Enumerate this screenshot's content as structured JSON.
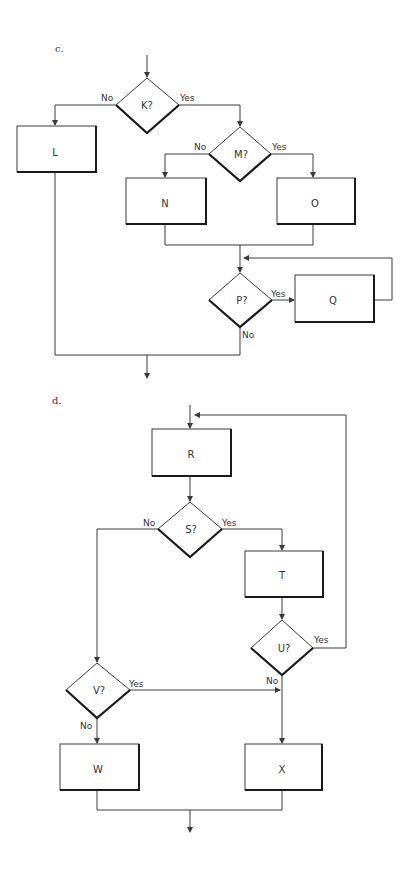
{
  "parts": {
    "c": {
      "label": "c.",
      "decisions": {
        "K": "K?",
        "M": "M?",
        "P": "P?"
      },
      "processes": {
        "L": "L",
        "N": "N",
        "O": "O",
        "Q": "Q"
      },
      "edges": {
        "k_no": "No",
        "k_yes": "Yes",
        "m_no": "No",
        "m_yes": "Yes",
        "p_yes": "Yes",
        "p_no": "No"
      }
    },
    "d": {
      "label": "d.",
      "decisions": {
        "S": "S?",
        "U": "U?",
        "V": "V?"
      },
      "processes": {
        "R": "R",
        "T": "T",
        "W": "W",
        "X": "X"
      },
      "edges": {
        "s_no": "No",
        "s_yes": "Yes",
        "u_yes": "Yes",
        "u_no": "No",
        "v_yes": "Yes",
        "v_no": "No"
      }
    }
  },
  "colors": {
    "line": "#3a3a3a",
    "shadow": "#1a1a1a",
    "background": "#ffffff"
  }
}
